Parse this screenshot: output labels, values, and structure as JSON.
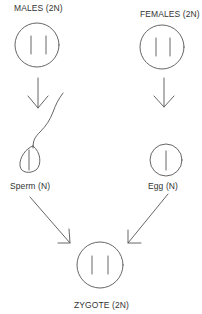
{
  "diagram": {
    "nodes": {
      "males": {
        "label": "MALES  (2N)",
        "chromosomes": 2
      },
      "females": {
        "label": "FEMALES (2N)",
        "chromosomes": 2
      },
      "sperm": {
        "label": "Sperm  (N)",
        "chromosomes": 1
      },
      "egg": {
        "label": "Egg  (N)",
        "chromosomes": 1
      },
      "zygote": {
        "label": "ZYGOTE  (2N)",
        "chromosomes": 2
      }
    },
    "edges": [
      {
        "from": "males",
        "to": "sperm"
      },
      {
        "from": "females",
        "to": "egg"
      },
      {
        "from": "sperm",
        "to": "zygote"
      },
      {
        "from": "egg",
        "to": "zygote"
      }
    ],
    "colors": {
      "stroke": "#555555",
      "background": "#ffffff"
    }
  }
}
